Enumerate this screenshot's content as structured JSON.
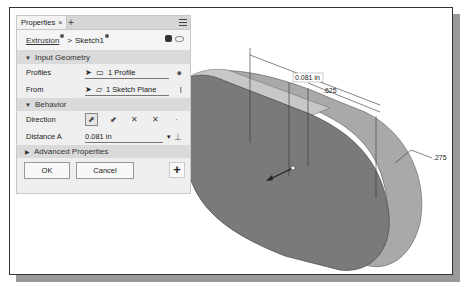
{
  "panel": {
    "tab_label": "Properties",
    "tab_close": "×",
    "tab_add": "+",
    "breadcrumb": {
      "feature": "Extrusion",
      "separator": ">",
      "sketch": "Sketch1"
    },
    "sections": {
      "input_geometry": "Input Geometry",
      "behavior": "Behavior",
      "advanced": "Advanced Properties"
    },
    "profiles": {
      "label": "Profiles",
      "value": "1 Profile"
    },
    "from": {
      "label": "From",
      "value": "1 Sketch Plane"
    },
    "direction": {
      "label": "Direction"
    },
    "distance_a": {
      "label": "Distance A",
      "value": "0.081 in"
    },
    "buttons": {
      "ok": "OK",
      "cancel": "Cancel",
      "plus": "+"
    }
  },
  "viewport": {
    "dimensions": {
      "extrude_depth": "0.081 in",
      "width": ".625",
      "radius": ".275"
    }
  },
  "colors": {
    "face": "#7a7a7a",
    "side": "#a9a9a9",
    "top": "#c4c4c4"
  }
}
